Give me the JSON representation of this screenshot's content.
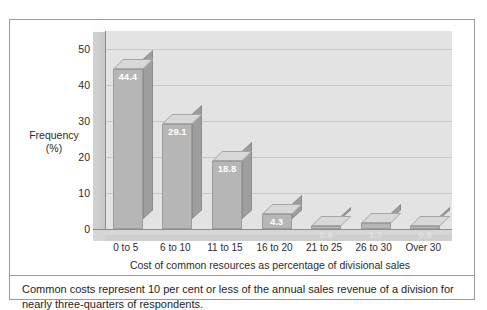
{
  "figure": {
    "caption": "Common costs represent 10 per cent or less of the annual sales revenue of a division for nearly three-quarters of respondents."
  },
  "chart_data": {
    "type": "bar",
    "title": "",
    "subtitle": "",
    "xlabel": "Cost of common resources as percentage of divisional sales",
    "ylabel": "Frequency (%)",
    "ylabel_line1": "Frequency",
    "ylabel_line2": "(%)",
    "categories": [
      "0 to 5",
      "6 to 10",
      "11 to 15",
      "16 to 20",
      "21 to 25",
      "26 to 30",
      "Over 30"
    ],
    "values": [
      44.4,
      29.1,
      18.8,
      4.3,
      0.9,
      1.7,
      0.9
    ],
    "labels": [
      "44.4",
      "29.1",
      "18.8",
      "4.3",
      "0.9",
      "1.7",
      "0.9"
    ],
    "yticks": [
      0,
      10,
      20,
      30,
      40,
      50
    ],
    "ytick_labels": [
      "0",
      "10",
      "20",
      "30",
      "40",
      "50"
    ],
    "ylim": [
      0,
      55
    ],
    "grid": true,
    "legend": "none",
    "style": "3d-column",
    "colors": {
      "bar_front": "#b6b6b6",
      "bar_top": "#d8d8d8",
      "bar_side": "#9e9e9e",
      "plot_background": "#e3e3e3",
      "gridline": "#c9c9c9",
      "axis": "#8d8d8d",
      "label_text": "#ffffff",
      "text": "#2b2b2b",
      "frame": "#9a9a9a"
    }
  }
}
